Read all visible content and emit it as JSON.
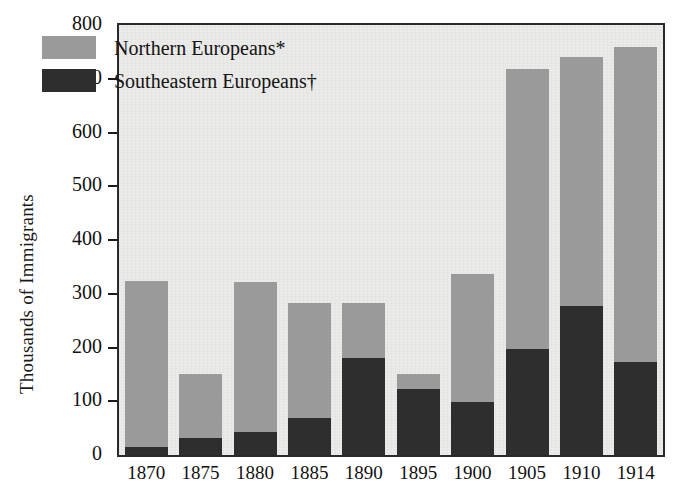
{
  "chart_data": {
    "type": "bar",
    "subtype": "stacked-bar",
    "title": "",
    "xlabel": "",
    "ylabel": "Thousands of Immigrants",
    "categories": [
      "1870",
      "1875",
      "1880",
      "1885",
      "1890",
      "1895",
      "1900",
      "1905",
      "1910",
      "1914"
    ],
    "series": [
      {
        "name": "Southeastern Europeans†",
        "color": "#2e2e2e",
        "values": [
          15,
          32,
          42,
          68,
          180,
          122,
          98,
          197,
          278,
          173
        ]
      },
      {
        "name": "Northern Europeans*",
        "color": "#9a9a9a",
        "values": [
          308,
          118,
          280,
          215,
          103,
          28,
          238,
          521,
          462,
          587
        ]
      }
    ],
    "totals": [
      323,
      150,
      322,
      283,
      283,
      150,
      336,
      718,
      740,
      760
    ],
    "ylim": [
      0,
      800
    ],
    "yticks": [
      0,
      100,
      200,
      300,
      400,
      500,
      600,
      700,
      800
    ],
    "ytick_labels": [
      "0",
      "100",
      "200",
      "300",
      "400",
      "500",
      "600",
      "700",
      "800"
    ],
    "grid": false,
    "legend_position": "top-left",
    "legend": [
      {
        "label": "Northern Europeans*",
        "color": "#9a9a9a"
      },
      {
        "label": "Southeastern Europeans†",
        "color": "#2e2e2e"
      }
    ]
  },
  "colors": {
    "northern": "#9a9a9a",
    "southeastern": "#2e2e2e",
    "plot_background": "#e8e8e6",
    "frame": "#2a2a2a",
    "text": "#111111",
    "page_background": "#ffffff"
  }
}
